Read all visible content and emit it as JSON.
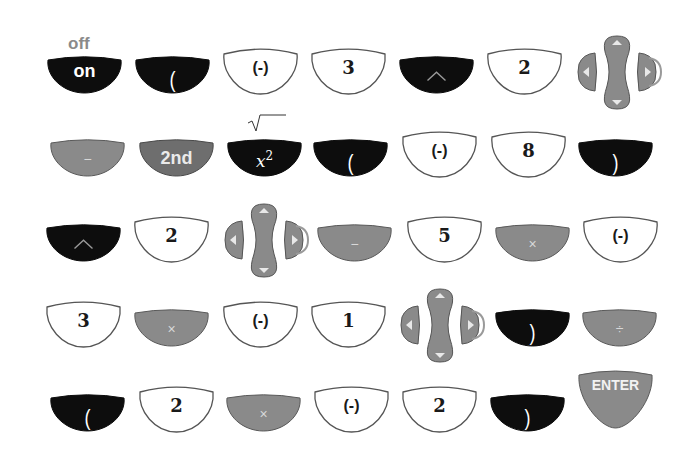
{
  "colors": {
    "dark": "#0d0d0d",
    "gray": "#8a8a8a",
    "gray_dark": "#6e6e6e",
    "white": "#ffffff",
    "outline": "#555555",
    "aux_label": "#8a8a8a"
  },
  "rows": [
    {
      "keys": [
        {
          "id": "on",
          "label": "on",
          "style": "dark",
          "font": "sans",
          "aux": "off"
        },
        {
          "id": "lparen",
          "label": "(",
          "style": "dark",
          "font": "sans"
        },
        {
          "id": "neg",
          "label": "(-)",
          "style": "white",
          "font": "sans"
        },
        {
          "id": "three",
          "label": "3",
          "style": "white",
          "font": "serif"
        },
        {
          "id": "caret",
          "label": "^",
          "style": "dark",
          "font": "sans",
          "icon": "caret-icon"
        },
        {
          "id": "two",
          "label": "2",
          "style": "white",
          "font": "serif"
        },
        {
          "id": "dpad-right",
          "label": "",
          "style": "dpad",
          "highlight": "right"
        }
      ]
    },
    {
      "keys": [
        {
          "id": "minus",
          "label": "−",
          "style": "gray",
          "font": "sans"
        },
        {
          "id": "second",
          "label": "2nd",
          "style": "graydark",
          "font": "sans"
        },
        {
          "id": "xsquared",
          "label": "x",
          "sup": "2",
          "style": "dark",
          "font": "serif-italic",
          "aux": "√‾‾"
        },
        {
          "id": "lparen",
          "label": "(",
          "style": "dark",
          "font": "sans"
        },
        {
          "id": "neg",
          "label": "(-)",
          "style": "white",
          "font": "sans"
        },
        {
          "id": "eight",
          "label": "8",
          "style": "white",
          "font": "serif"
        },
        {
          "id": "rparen",
          "label": ")",
          "style": "dark",
          "font": "sans"
        }
      ]
    },
    {
      "keys": [
        {
          "id": "caret",
          "label": "^",
          "style": "dark",
          "font": "sans",
          "icon": "caret-icon"
        },
        {
          "id": "two",
          "label": "2",
          "style": "white",
          "font": "serif"
        },
        {
          "id": "dpad-right",
          "label": "",
          "style": "dpad",
          "highlight": "right"
        },
        {
          "id": "minus",
          "label": "−",
          "style": "gray",
          "font": "sans"
        },
        {
          "id": "five",
          "label": "5",
          "style": "white",
          "font": "serif"
        },
        {
          "id": "times",
          "label": "×",
          "style": "gray",
          "font": "sans"
        },
        {
          "id": "neg",
          "label": "(-)",
          "style": "white",
          "font": "sans"
        }
      ]
    },
    {
      "keys": [
        {
          "id": "three",
          "label": "3",
          "style": "white",
          "font": "serif"
        },
        {
          "id": "times",
          "label": "×",
          "style": "gray",
          "font": "sans"
        },
        {
          "id": "neg",
          "label": "(-)",
          "style": "white",
          "font": "sans"
        },
        {
          "id": "one",
          "label": "1",
          "style": "white",
          "font": "serif"
        },
        {
          "id": "dpad-right",
          "label": "",
          "style": "dpad",
          "highlight": "right"
        },
        {
          "id": "rparen",
          "label": ")",
          "style": "dark",
          "font": "sans"
        },
        {
          "id": "divide",
          "label": "÷",
          "style": "gray",
          "font": "sans"
        }
      ]
    },
    {
      "keys": [
        {
          "id": "lparen",
          "label": "(",
          "style": "dark",
          "font": "sans"
        },
        {
          "id": "two",
          "label": "2",
          "style": "white",
          "font": "serif"
        },
        {
          "id": "times",
          "label": "×",
          "style": "gray",
          "font": "sans"
        },
        {
          "id": "neg",
          "label": "(-)",
          "style": "white",
          "font": "sans"
        },
        {
          "id": "two",
          "label": "2",
          "style": "white",
          "font": "serif"
        },
        {
          "id": "rparen",
          "label": ")",
          "style": "dark",
          "font": "sans"
        },
        {
          "id": "enter",
          "label": "ENTER",
          "style": "enter",
          "font": "sans"
        }
      ]
    }
  ]
}
